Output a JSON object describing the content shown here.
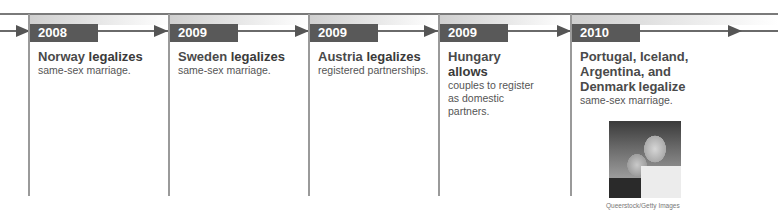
{
  "timeline": {
    "entries": [
      {
        "year": "2008",
        "subject": "Norway",
        "verb": "legalizes",
        "detail": "same-sex marriage."
      },
      {
        "year": "2009",
        "subject": "Sweden",
        "verb": "legalizes",
        "detail": "same-sex marriage."
      },
      {
        "year": "2009",
        "subject": "Austria",
        "verb": "legalizes",
        "detail": "registered partnerships."
      },
      {
        "year": "2009",
        "subject": "Hungary",
        "verb": "allows",
        "detail": "couples to register as domestic partners."
      },
      {
        "year": "2010",
        "subject": "Portugal, Iceland, Argentina, and Denmark",
        "verb": "legalize",
        "detail": "same-sex marriage."
      }
    ],
    "photo_credit": "Queerstock/Getty Images",
    "photo_alt": "photo-of-couple"
  },
  "colors": {
    "year_label_bg": "#595959",
    "axis": "#6a6a6a",
    "divider": "#9a9a9a"
  }
}
